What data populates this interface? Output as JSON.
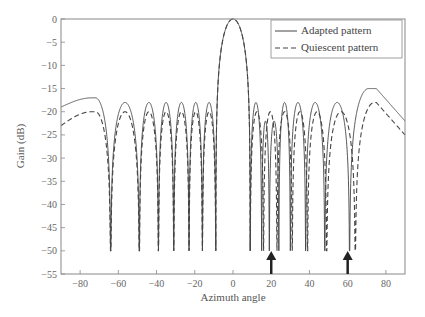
{
  "chart_data": {
    "type": "line",
    "title": "",
    "xlabel": "Azimuth angle",
    "ylabel": "Gain (dB)",
    "xlim": [
      -90,
      90
    ],
    "ylim": [
      -55,
      0
    ],
    "xticks": [
      -80,
      -60,
      -40,
      -20,
      0,
      20,
      40,
      60,
      80
    ],
    "yticks": [
      0,
      -5,
      -10,
      -15,
      -20,
      -25,
      -30,
      -35,
      -40,
      -45,
      -50,
      -55
    ],
    "grid": false,
    "legend_position": "upper right",
    "legend": [
      "Adapted pattern",
      "Quiescent pattern"
    ],
    "annotations": [
      {
        "type": "arrow",
        "x": 20,
        "label": "jammer direction"
      },
      {
        "type": "arrow",
        "x": 60,
        "label": "jammer direction"
      }
    ],
    "model": {
      "elements": 16,
      "spacing_wavelengths": 0.5,
      "taper_db": 18
    },
    "series": [
      {
        "name": "Adapted pattern",
        "style": "solid",
        "color": "#444444",
        "null_angles": [
          -64,
          -49,
          -39,
          -31,
          -23,
          -16,
          -9,
          9,
          15,
          19,
          24,
          30,
          38,
          48,
          61
        ],
        "null_depth": -50,
        "sidelobe_peak_db": -18,
        "edge_values": {
          "-90": -19,
          "-80": -17,
          "75": -15,
          "90": -22
        },
        "x": [
          -90,
          -85,
          -80,
          -75,
          -70,
          -65,
          -60,
          -55,
          -50,
          -45,
          -40,
          -35,
          -30,
          -25,
          -20,
          -15,
          -10,
          -5,
          0,
          5,
          10,
          15,
          20,
          25,
          30,
          35,
          40,
          45,
          50,
          55,
          60,
          65,
          70,
          75,
          80,
          85,
          90
        ],
        "values": [
          -19,
          -18,
          -17,
          -18,
          -22,
          -50,
          -20,
          -18,
          -50,
          -18,
          -48,
          -18,
          -50,
          -18,
          -30,
          -18,
          -45,
          -5,
          0,
          -5,
          -45,
          -50,
          -50,
          -20,
          -50,
          -17,
          -50,
          -17,
          -48,
          -20,
          -50,
          -25,
          -17,
          -15,
          -17,
          -20,
          -22
        ]
      },
      {
        "name": "Quiescent pattern",
        "style": "dashed",
        "color": "#444444",
        "null_angles": [
          -64,
          -49,
          -39,
          -31,
          -23,
          -16,
          -9,
          9,
          16,
          23,
          31,
          39,
          49,
          64
        ],
        "null_depth": -50,
        "sidelobe_peak_db": -20,
        "edge_values": {
          "-90": -23,
          "-80": -20,
          "75": -18,
          "90": -25
        },
        "x": [
          -90,
          -85,
          -80,
          -75,
          -70,
          -65,
          -60,
          -55,
          -50,
          -45,
          -40,
          -35,
          -30,
          -25,
          -20,
          -15,
          -10,
          -5,
          0,
          5,
          10,
          15,
          20,
          25,
          30,
          35,
          40,
          45,
          50,
          55,
          60,
          65,
          70,
          75,
          80,
          85,
          90
        ],
        "values": [
          -23,
          -21,
          -20,
          -21,
          -26,
          -50,
          -22,
          -20,
          -50,
          -20,
          -48,
          -20,
          -50,
          -20,
          -28,
          -20,
          -45,
          -5,
          0,
          -5,
          -45,
          -28,
          -20,
          -28,
          -50,
          -20,
          -50,
          -20,
          -48,
          -22,
          -26,
          -50,
          -22,
          -18,
          -20,
          -23,
          -25
        ]
      }
    ]
  },
  "axes": {
    "xlabel": "Azimuth angle",
    "ylabel": "Gain (dB)"
  },
  "legend": {
    "items": [
      "Adapted pattern",
      "Quiescent pattern"
    ]
  }
}
